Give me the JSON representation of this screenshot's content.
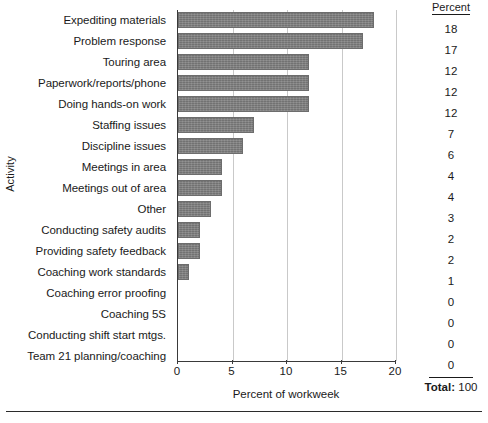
{
  "chart_data": {
    "type": "bar",
    "orientation": "horizontal",
    "title": "",
    "xlabel": "Percent of workweek",
    "ylabel": "Activity",
    "xlim": [
      0,
      20
    ],
    "xticks": [
      0,
      5,
      10,
      15,
      20
    ],
    "grid": "vertical",
    "legend": "none",
    "bar_color": "#7d7d7d",
    "categories": [
      "Expediting materials",
      "Problem response",
      "Touring area",
      "Paperwork/reports/phone",
      "Doing hands-on work",
      "Staffing issues",
      "Discipline issues",
      "Meetings in area",
      "Meetings out of area",
      "Other",
      "Conducting safety audits",
      "Providing safety feedback",
      "Coaching work standards",
      "Coaching error proofing",
      "Coaching 5S",
      "Conducting shift start mtgs.",
      "Team 21 planning/coaching"
    ],
    "values": [
      18,
      17,
      12,
      12,
      12,
      7,
      6,
      4,
      4,
      3,
      2,
      2,
      1,
      0,
      0,
      0,
      0
    ]
  },
  "percent_table": {
    "header": "Percent",
    "values": [
      "18",
      "17",
      "12",
      "12",
      "12",
      "7",
      "6",
      "4",
      "4",
      "3",
      "2",
      "2",
      "1",
      "0",
      "0",
      "0",
      "0"
    ],
    "total_label": "Total:",
    "total_value": "100"
  },
  "axes": {
    "x_title": "Percent of workweek",
    "y_title": "Activity",
    "x_tick_labels": [
      "0",
      "5",
      "10",
      "15",
      "20"
    ]
  }
}
